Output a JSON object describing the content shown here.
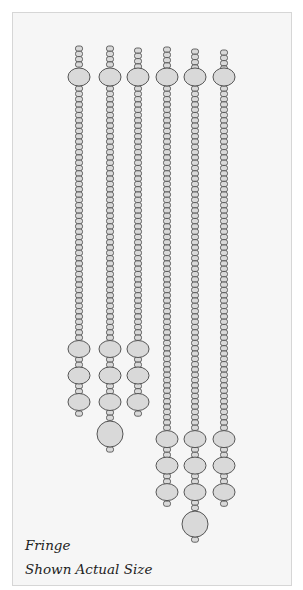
{
  "figure": {
    "title": "Fringe",
    "subtitle": "Shown Actual Size"
  },
  "colors": {
    "panel_bg": "#f6f6f6",
    "bead_fill": "#d9d9d9",
    "bead_stroke": "#555555"
  },
  "strands": [
    {
      "id": 1,
      "top_small_beads": 4,
      "seed_count": 48,
      "lower_large_beads": 3,
      "drop_bead": false
    },
    {
      "id": 2,
      "top_small_beads": 4,
      "seed_count": 48,
      "lower_large_beads": 3,
      "drop_bead": true
    },
    {
      "id": 3,
      "top_small_beads": 4,
      "seed_count": 48,
      "lower_large_beads": 3,
      "drop_bead": false
    },
    {
      "id": 4,
      "top_small_beads": 4,
      "seed_count": 65,
      "lower_large_beads": 3,
      "drop_bead": false
    },
    {
      "id": 5,
      "top_small_beads": 4,
      "seed_count": 65,
      "lower_large_beads": 3,
      "drop_bead": true
    },
    {
      "id": 6,
      "top_small_beads": 4,
      "seed_count": 65,
      "lower_large_beads": 3,
      "drop_bead": false
    }
  ]
}
